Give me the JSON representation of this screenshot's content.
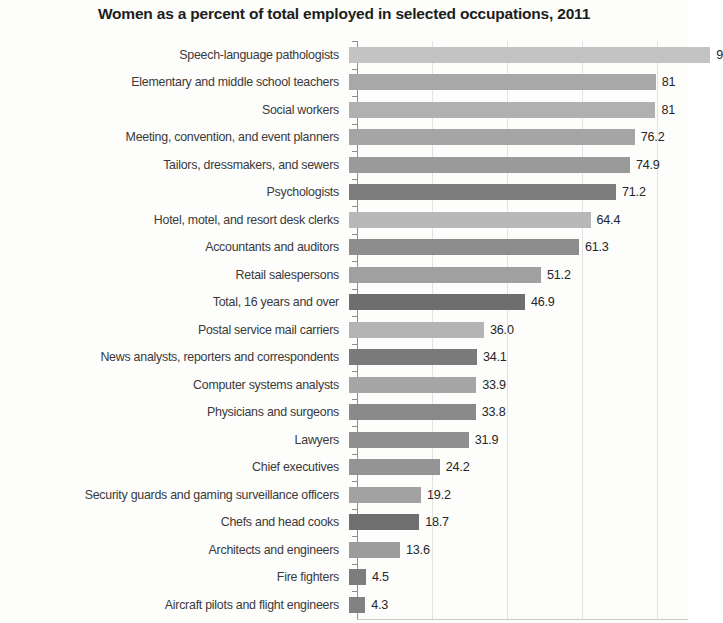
{
  "chart_data": {
    "type": "bar",
    "orientation": "horizontal",
    "title": "Women as a percent of total employed in selected occupations, 2011",
    "xlabel": "",
    "ylabel": "",
    "xlim": [
      0,
      100
    ],
    "grid": true,
    "gridline_values": [
      20,
      40,
      60,
      80
    ],
    "legend": null,
    "categories": [
      "Speech-language pathologists",
      "Elementary and middle school teachers",
      "Social workers",
      "Meeting, convention, and event planners",
      "Tailors, dressmakers, and sewers",
      "Psychologists",
      "Hotel, motel, and resort desk clerks",
      "Accountants and auditors",
      "Retail salespersons",
      "Total, 16 years and over",
      "Postal service mail carriers",
      "News analysts, reporters and correspondents",
      "Computer systems analysts",
      "Physicians and surgeons",
      "Lawyers",
      "Chief executives",
      "Security guards and gaming surveillance officers",
      "Chefs and head cooks",
      "Architects and engineers",
      "Fire fighters",
      "Aircraft pilots and flight engineers"
    ],
    "values": [
      96.3,
      81.8,
      81.7,
      76.2,
      74.9,
      71.2,
      64.4,
      61.3,
      51.2,
      46.9,
      36.0,
      34.1,
      33.9,
      33.8,
      31.9,
      24.2,
      19.2,
      18.7,
      13.6,
      4.5,
      4.3
    ],
    "value_labels": [
      "9",
      "81",
      "81",
      "76.2",
      "74.9",
      "71.2",
      "64.4",
      "61.3",
      "51.2",
      "46.9",
      "36.0",
      "34.1",
      "33.9",
      "33.8",
      "31.9",
      "24.2",
      "19.2",
      "18.7",
      "13.6",
      "4.5",
      "4.3"
    ],
    "bar_colors": [
      "#c3c3c3",
      "#a8a8a8",
      "#b0b0b0",
      "#a5a5a5",
      "#9a9a9a",
      "#7c7c7c",
      "#b8b8b8",
      "#8d8d8d",
      "#a0a0a0",
      "#6e6e6e",
      "#b4b4b4",
      "#7a7a7a",
      "#a6a6a6",
      "#8a8a8a",
      "#8f8f8f",
      "#949494",
      "#a2a2a2",
      "#6f6f6f",
      "#9c9c9c",
      "#7d7d7d",
      "#828282"
    ]
  },
  "axis": {
    "origin_x_px": 357,
    "px_per_unit": 3.75
  }
}
